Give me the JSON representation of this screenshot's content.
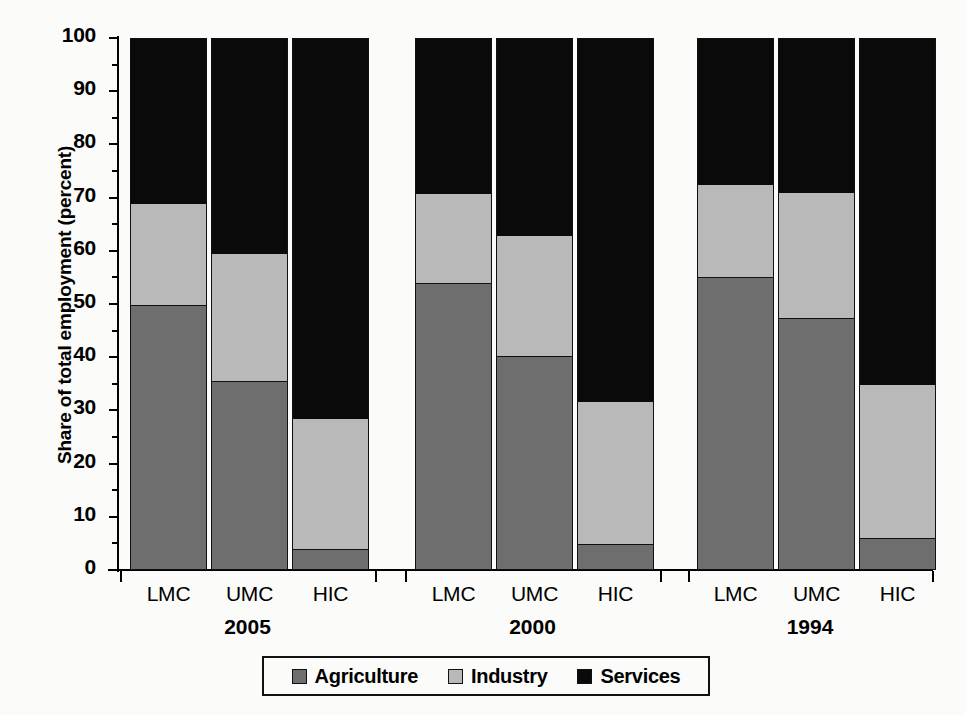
{
  "chart_data": {
    "type": "bar",
    "subtype": "stacked-bar-grouped",
    "title": "",
    "xlabel": "",
    "ylabel": "Share of total employment (percent)",
    "ylim": [
      0,
      100
    ],
    "yticks": [
      0,
      10,
      20,
      30,
      40,
      50,
      60,
      70,
      80,
      90,
      100
    ],
    "ytick_labels": [
      "0",
      "10",
      "20",
      "30",
      "40",
      "50",
      "60",
      "70",
      "80",
      "90",
      "100"
    ],
    "grid": false,
    "legend_position": "bottom-center",
    "groups": [
      "2005",
      "2000",
      "1994"
    ],
    "categories": [
      "LMC",
      "UMC",
      "HIC"
    ],
    "series": [
      {
        "name": "Agriculture",
        "color": "#6e6e6e",
        "values": [
          [
            49.8,
            35.5,
            4.0
          ],
          [
            54.0,
            40.2,
            4.8
          ],
          [
            55.0,
            47.3,
            6.0
          ]
        ]
      },
      {
        "name": "Industry",
        "color": "#b9b9b9",
        "values": [
          [
            19.2,
            24.1,
            24.6
          ],
          [
            16.8,
            22.8,
            26.9
          ],
          [
            17.5,
            23.8,
            29.0
          ]
        ]
      },
      {
        "name": "Services",
        "color": "#0a0a0a",
        "values": [
          [
            31.0,
            40.4,
            71.4
          ],
          [
            29.2,
            37.0,
            68.3
          ],
          [
            27.5,
            28.9,
            65.0
          ]
        ]
      }
    ],
    "cumulative_tops": {
      "agriculture": [
        [
          49.8,
          35.5,
          4.0
        ],
        [
          54.0,
          40.2,
          4.8
        ],
        [
          55.0,
          47.3,
          6.0
        ]
      ],
      "industry": [
        [
          69.0,
          59.6,
          28.6
        ],
        [
          70.8,
          63.0,
          31.7
        ],
        [
          72.5,
          71.1,
          35.0
        ]
      ],
      "services": [
        [
          100,
          100,
          100
        ],
        [
          100,
          100,
          100
        ],
        [
          100,
          100,
          100
        ]
      ]
    }
  },
  "axis": {
    "y_title": "Share of total employment (percent)"
  },
  "legend": {
    "items": [
      {
        "label": "Agriculture",
        "swatch": "swatch-agriculture"
      },
      {
        "label": "Industry",
        "swatch": "swatch-industry"
      },
      {
        "label": "Services",
        "swatch": "swatch-services"
      }
    ]
  }
}
